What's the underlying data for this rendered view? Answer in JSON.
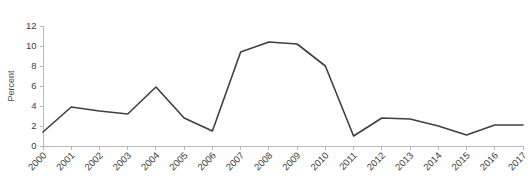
{
  "chart_data": {
    "type": "line",
    "title": "",
    "subtitle": "",
    "xlabel": "",
    "ylabel": "Percent",
    "categories": [
      "2000",
      "2001",
      "2002",
      "2003",
      "2004",
      "2005",
      "2006",
      "2007",
      "2008",
      "2009",
      "2010",
      "2011",
      "2012",
      "2013",
      "2014",
      "2015",
      "2016",
      "2017"
    ],
    "values": [
      1.4,
      3.9,
      3.5,
      3.2,
      5.9,
      2.8,
      1.5,
      9.4,
      10.4,
      10.2,
      8.0,
      1.0,
      2.8,
      2.7,
      2.0,
      1.1,
      2.1,
      2.1
    ],
    "series": [
      {
        "name": "Percent",
        "values": [
          1.4,
          3.9,
          3.5,
          3.2,
          5.9,
          2.8,
          1.5,
          9.4,
          10.4,
          10.2,
          8.0,
          1.0,
          2.8,
          2.7,
          2.0,
          1.1,
          2.1,
          2.1
        ]
      }
    ],
    "ylim": [
      0,
      12
    ],
    "yticks": [
      0,
      2,
      4,
      6,
      8,
      10,
      12
    ],
    "ytick_labels": [
      "0",
      "2",
      "4",
      "6",
      "8",
      "10",
      "12"
    ],
    "xtick_labels": [
      "2000",
      "2001",
      "2002",
      "2003",
      "2004",
      "2005",
      "2006",
      "2007",
      "2008",
      "2009",
      "2010",
      "2011",
      "2012",
      "2013",
      "2014",
      "2015",
      "2016",
      "2017"
    ],
    "xtick_rotation": 45,
    "grid": false,
    "legend": false,
    "legend_position": "none",
    "line_color": "#3f3f3f",
    "axis_color": "#b9b9b9",
    "text_color": "#3d3d3d",
    "background_color": "#ffffff",
    "annotations": []
  },
  "layout": {
    "plot_left": 43,
    "plot_right": 523,
    "plot_top": 26,
    "plot_bottom": 146,
    "width": 531,
    "height": 188
  }
}
